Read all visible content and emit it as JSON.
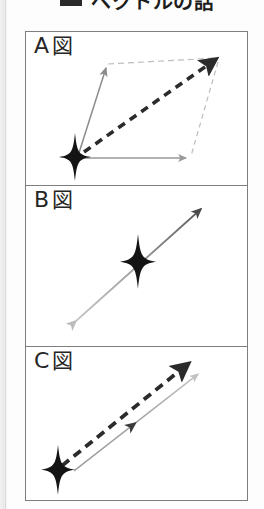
{
  "title": {
    "bullet_icon": "square-bullet-icon",
    "text": "ベクトルの話"
  },
  "figure": {
    "panels": [
      {
        "id": "panel-a",
        "label_letter": "A",
        "label_suffix": "図",
        "description": "parallelogram vector addition diagram",
        "elements": [
          "origin-star",
          "gray-vector-up-left",
          "gray-vector-right",
          "dashed-construction-top",
          "dashed-construction-right",
          "bold-dashed-resultant-vector"
        ]
      },
      {
        "id": "panel-b",
        "label_letter": "B",
        "label_suffix": "図",
        "description": "double-headed gradient vector line through central star",
        "elements": [
          "center-star",
          "gradient-double-arrow"
        ]
      },
      {
        "id": "panel-c",
        "label_letter": "C",
        "label_suffix": "図",
        "description": "two parallel vectors from origin star",
        "elements": [
          "origin-star",
          "bold-dashed-vector",
          "gray-vector-with-mid-arrowhead"
        ]
      }
    ]
  },
  "colors": {
    "ink": "#1d1d1d",
    "frame": "#7e7e7e",
    "gray_vector": "#8c8c8c",
    "light_gray": "#bdbdbd",
    "dark_arrow": "#4a4a4a",
    "paper": "#ffffff"
  }
}
